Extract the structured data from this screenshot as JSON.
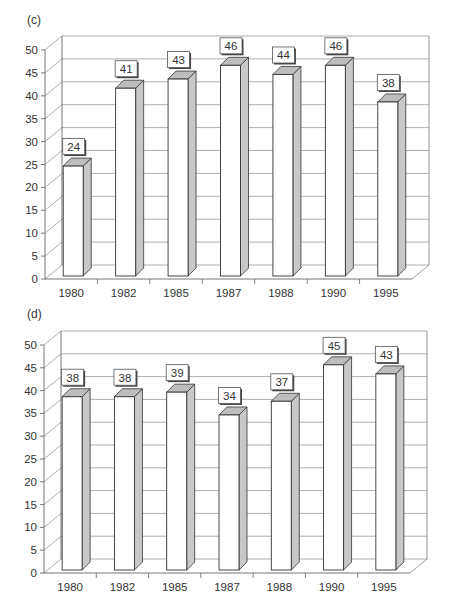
{
  "chart_data": [
    {
      "type": "bar",
      "style": "3d-column",
      "panel_label": "(c)",
      "title": "",
      "xlabel": "",
      "ylabel": "",
      "categories": [
        "1980",
        "1982",
        "1985",
        "1987",
        "1988",
        "1990",
        "1995"
      ],
      "values": [
        24,
        41,
        43,
        46,
        44,
        46,
        38
      ],
      "data_labels": [
        "24",
        "41",
        "43",
        "46",
        "44",
        "46",
        "38"
      ],
      "yticks": [
        0,
        5,
        10,
        15,
        20,
        25,
        30,
        35,
        40,
        45,
        50
      ],
      "ylim": [
        0,
        50
      ],
      "grid": true,
      "legend": null
    },
    {
      "type": "bar",
      "style": "3d-column",
      "panel_label": "(d)",
      "title": "",
      "xlabel": "",
      "ylabel": "",
      "categories": [
        "1980",
        "1982",
        "1985",
        "1987",
        "1988",
        "1990",
        "1995"
      ],
      "values": [
        38,
        38,
        39,
        34,
        37,
        45,
        43
      ],
      "data_labels": [
        "38",
        "38",
        "39",
        "34",
        "37",
        "45",
        "43"
      ],
      "yticks": [
        0,
        5,
        10,
        15,
        20,
        25,
        30,
        35,
        40,
        45,
        50
      ],
      "ylim": [
        0,
        50
      ],
      "grid": true,
      "legend": null
    }
  ],
  "colors": {
    "bar_front": "#ffffff",
    "bar_side": "#c8c8c8",
    "bar_top": "#bdbdbd",
    "outline": "#333333",
    "grid": "#9a9a9a"
  }
}
